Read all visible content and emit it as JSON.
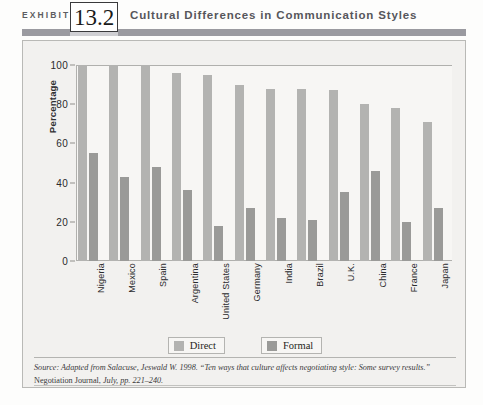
{
  "header": {
    "exhibit_word": "EXHIBIT",
    "exhibit_number": "13.2",
    "title": "Cultural Differences in Communication Styles"
  },
  "legend": {
    "items": [
      {
        "label": "Direct",
        "color": "#b3b3b1"
      },
      {
        "label": "Formal",
        "color": "#9a9a98"
      }
    ]
  },
  "source": {
    "part1": "Source: Adapted from Salacuse, Jeswald W. 1998. “Ten ways that culture affects negotiating style: Some survey results.” ",
    "part2": "Negotiation Journal, ",
    "part3": "July, pp. 221–240."
  },
  "chart_data": {
    "type": "bar",
    "title": "Cultural Differences in Communication Styles",
    "xlabel": "",
    "ylabel": "Percentage",
    "ylim": [
      0,
      100
    ],
    "yticks": [
      0,
      20,
      40,
      60,
      80,
      100
    ],
    "grid": false,
    "legend_position": "bottom",
    "categories": [
      "Nigeria",
      "Mexico",
      "Spain",
      "Argentina",
      "United States",
      "Germany",
      "India",
      "Brazil",
      "U.K.",
      "China",
      "France",
      "Japan"
    ],
    "series": [
      {
        "name": "Direct",
        "color": "#b3b3b1",
        "values": [
          100,
          100,
          100,
          96,
          95,
          90,
          88,
          88,
          87,
          80,
          78,
          71
        ]
      },
      {
        "name": "Formal",
        "color": "#9a9a98",
        "values": [
          55,
          43,
          48,
          36,
          18,
          27,
          22,
          21,
          35,
          46,
          20,
          27
        ]
      }
    ]
  }
}
